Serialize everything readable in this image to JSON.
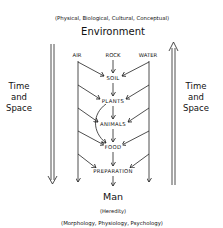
{
  "diagram": {
    "caption_top": "(Physical, Biological, Cultural, Conceptual)",
    "title_top": "Environment",
    "sources": [
      {
        "label": "AIR",
        "x": 77
      },
      {
        "label": "ROCK",
        "x": 113
      },
      {
        "label": "WATER",
        "x": 148
      }
    ],
    "chain": [
      {
        "label": "SOIL",
        "y": 75
      },
      {
        "label": "PLANTS",
        "y": 98
      },
      {
        "label": "ANIMALS",
        "y": 121
      },
      {
        "label": "FOOD",
        "y": 144
      },
      {
        "label": "PREPARATION",
        "y": 168
      }
    ],
    "left_axis": {
      "line1": "Time",
      "line2": "and",
      "line3": "Space",
      "direction": "down"
    },
    "right_axis": {
      "line1": "Time",
      "line2": "and",
      "line3": "Space",
      "direction": "up"
    },
    "title_bottom": "Man",
    "subtitle_bottom": "(Heredity)",
    "caption_bottom": "(Morphology, Physiology, Psychology)",
    "colors": {
      "line": "#222222",
      "background": "#ffffff"
    }
  }
}
